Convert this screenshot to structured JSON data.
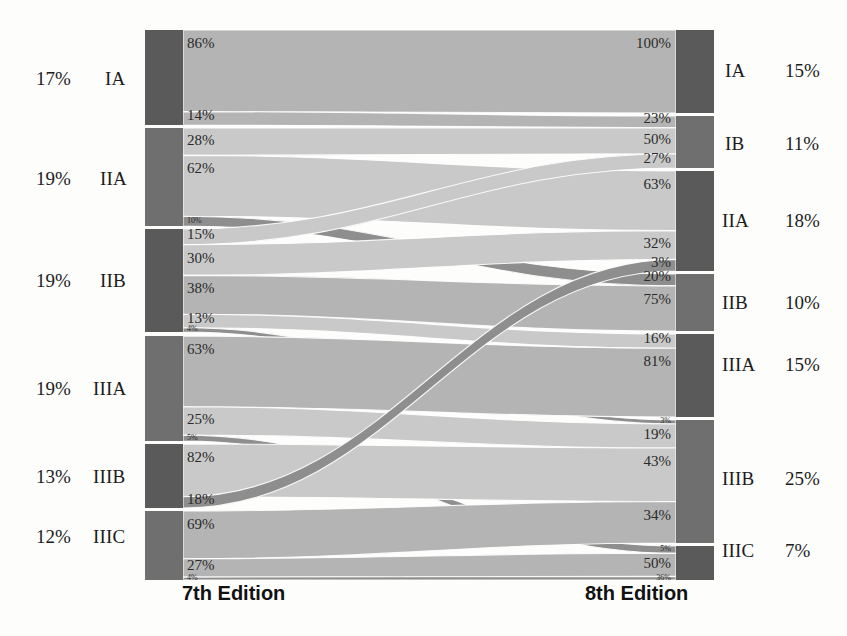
{
  "chart_data": {
    "type": "sankey",
    "title": "",
    "left_axis_title": "7th Edition",
    "right_axis_title": "8th Edition",
    "left_nodes": [
      {
        "id": "L-IA",
        "label": "IA",
        "share": "17%",
        "y0": 30,
        "y1": 125
      },
      {
        "id": "L-IIA",
        "label": "IIA",
        "share": "19%",
        "y0": 128,
        "y1": 226
      },
      {
        "id": "L-IIB",
        "label": "IIB",
        "share": "19%",
        "y0": 229,
        "y1": 332
      },
      {
        "id": "L-IIIA",
        "label": "IIIA",
        "share": "19%",
        "y0": 336,
        "y1": 441
      },
      {
        "id": "L-IIIB",
        "label": "IIIB",
        "share": "13%",
        "y0": 444,
        "y1": 508
      },
      {
        "id": "L-IIIC",
        "label": "IIIC",
        "share": "12%",
        "y0": 511,
        "y1": 580
      }
    ],
    "right_nodes": [
      {
        "id": "R-IA",
        "label": "IA",
        "share": "15%",
        "y0": 30,
        "y1": 113
      },
      {
        "id": "R-IB",
        "label": "IB",
        "share": "11%",
        "y0": 116,
        "y1": 168
      },
      {
        "id": "R-IIA",
        "label": "IIA",
        "share": "18%",
        "y0": 171,
        "y1": 271
      },
      {
        "id": "R-IIB",
        "label": "IIB",
        "share": "10%",
        "y0": 274,
        "y1": 331
      },
      {
        "id": "R-IIIA",
        "label": "IIIA",
        "share": "15%",
        "y0": 334,
        "y1": 417
      },
      {
        "id": "R-IIIB",
        "label": "IIIB",
        "share": "25%",
        "y0": 420,
        "y1": 543
      },
      {
        "id": "R-IIIC",
        "label": "IIIC",
        "share": "7%",
        "y0": 546,
        "y1": 580
      }
    ],
    "links": [
      {
        "source": "L-IA",
        "target": "R-IA",
        "source_pct": "86%",
        "target_pct": "100%",
        "value": 14.6,
        "shade": "mid"
      },
      {
        "source": "L-IA",
        "target": "R-IB",
        "source_pct": "14%",
        "target_pct": "23%",
        "value": 2.4,
        "shade": "mid"
      },
      {
        "source": "L-IIA",
        "target": "R-IB",
        "source_pct": "28%",
        "target_pct": "50%",
        "value": 5.3,
        "shade": "light"
      },
      {
        "source": "L-IIA",
        "target": "R-IIA",
        "source_pct": "62%",
        "target_pct": "63%",
        "value": 11.8,
        "shade": "light"
      },
      {
        "source": "L-IIA",
        "target": "R-IIB",
        "source_pct": "10%",
        "target_pct": "20%",
        "value": 1.9,
        "shade": "dark"
      },
      {
        "source": "L-IIB",
        "target": "R-IB",
        "source_pct": "15%",
        "target_pct": "27%",
        "value": 2.9,
        "shade": "light"
      },
      {
        "source": "L-IIB",
        "target": "R-IIA",
        "source_pct": "30%",
        "target_pct": "32%",
        "value": 5.7,
        "shade": "light"
      },
      {
        "source": "L-IIB",
        "target": "R-IIB",
        "source_pct": "38%",
        "target_pct": "75%",
        "value": 7.2,
        "shade": "mid"
      },
      {
        "source": "L-IIB",
        "target": "R-IIIA",
        "source_pct": "13%",
        "target_pct": "16%",
        "value": 2.5,
        "shade": "light"
      },
      {
        "source": "L-IIB",
        "target": "R-IIIB",
        "source_pct": "4%",
        "target_pct": "3%",
        "value": 0.8,
        "shade": "dark"
      },
      {
        "source": "L-IIIA",
        "target": "R-IIIA",
        "source_pct": "63%",
        "target_pct": "81%",
        "value": 12.0,
        "shade": "mid"
      },
      {
        "source": "L-IIIA",
        "target": "R-IIIB",
        "source_pct": "25%",
        "target_pct": "19%",
        "value": 4.8,
        "shade": "light"
      },
      {
        "source": "L-IIIA",
        "target": "R-IIIC",
        "source_pct": "5%",
        "target_pct": "5%",
        "value": 1.0,
        "shade": "dark"
      },
      {
        "source": "L-IIIB",
        "target": "R-IIIB",
        "source_pct": "82%",
        "target_pct": "43%",
        "value": 10.7,
        "shade": "light"
      },
      {
        "source": "L-IIIB",
        "target": "R-IIA",
        "source_pct": "18%",
        "target_pct": "3%",
        "value": 2.3,
        "shade": "dark"
      },
      {
        "source": "L-IIIC",
        "target": "R-IIIB",
        "source_pct": "69%",
        "target_pct": "34%",
        "value": 8.3,
        "shade": "mid"
      },
      {
        "source": "L-IIIC",
        "target": "R-IIIC",
        "source_pct": "27%",
        "target_pct": "50%",
        "value": 3.2,
        "shade": "mid"
      },
      {
        "source": "L-IIIC",
        "target": "R-IIIC",
        "source_pct": "4%",
        "target_pct": "36%",
        "value": 0.5,
        "shade": "dark"
      }
    ],
    "colors": {
      "node_dark": "#5a5a5a",
      "node_mid": "#6f6f6f",
      "link_light": "#c9c9c9",
      "link_mid": "#b4b4b4",
      "link_dark": "#8e8e8e",
      "background": "#fdfdfc",
      "text": "#1c1c1c"
    },
    "geometry": {
      "left_node_x": 145,
      "left_node_w": 38,
      "right_node_x": 676,
      "right_node_w": 38,
      "flow_x0": 183,
      "flow_x1": 676
    }
  }
}
